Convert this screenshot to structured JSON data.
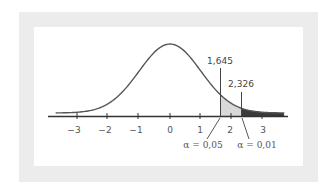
{
  "chart_data": {
    "type": "area",
    "title": "",
    "xlabel": "",
    "ylabel": "",
    "distribution": "standard normal",
    "xlim": [
      -3.7,
      3.7
    ],
    "x_ticks": [
      -3,
      -2,
      -1,
      0,
      1,
      2,
      3
    ],
    "x_tick_labels": [
      "−3",
      "−2",
      "−1",
      "0",
      "1",
      "2",
      "3"
    ],
    "grid": false,
    "critical_values": [
      {
        "z": 1.645,
        "label": "1,645",
        "alpha_label": "α = 0,05",
        "alpha": 0.05,
        "shade": "#d9d9d9"
      },
      {
        "z": 2.326,
        "label": "2,326",
        "alpha_label": "α = 0,01",
        "alpha": 0.01,
        "shade": "#3a3a3a"
      }
    ],
    "colors": {
      "curve": "#555555",
      "axis": "#333333",
      "frame": "#ececec",
      "panel": "#ffffff"
    }
  },
  "labels": {
    "tick_m3": "−3",
    "tick_m2": "−2",
    "tick_m1": "−1",
    "tick_0": "0",
    "tick_1": "1",
    "tick_2": "2",
    "tick_3": "3",
    "crit1": "1,645",
    "crit2": "2,326",
    "alpha1": "α = 0,05",
    "alpha2": "α = 0,01"
  }
}
